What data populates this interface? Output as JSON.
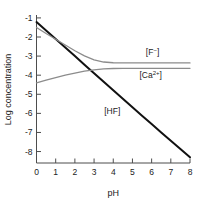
{
  "chart_data": {
    "type": "line",
    "title": "",
    "xlabel": "pH",
    "ylabel": "Log concentration",
    "xlim": [
      0,
      8
    ],
    "ylim": [
      -8.6,
      -0.9
    ],
    "xticks": [
      "0",
      "1",
      "2",
      "3",
      "4",
      "5",
      "6",
      "7",
      "8"
    ],
    "xtick_values": [
      0,
      1,
      2,
      3,
      4,
      5,
      6,
      7,
      8
    ],
    "yticks": [
      "-1",
      "-2",
      "-3",
      "-4",
      "-5",
      "-6",
      "-7",
      "-8"
    ],
    "ytick_values": [
      -1,
      -2,
      -3,
      -4,
      -5,
      -6,
      -7,
      -8
    ],
    "grid": false,
    "legend_position": "inline-annotations",
    "series": [
      {
        "name": "[HF]",
        "label": "[HF]",
        "color": "#111111",
        "width": 2.0,
        "x": [
          0,
          0.5,
          1,
          1.5,
          2,
          2.5,
          3,
          3.5,
          4,
          4.5,
          5,
          5.5,
          6,
          6.5,
          7,
          7.5,
          8
        ],
        "y": [
          -1.22,
          -1.66,
          -2.1,
          -2.55,
          -3.0,
          -3.45,
          -3.9,
          -4.35,
          -4.79,
          -5.24,
          -5.68,
          -6.12,
          -6.56,
          -7.0,
          -7.43,
          -7.87,
          -8.3
        ]
      },
      {
        "name": "[F-]",
        "label": "[F⁻]",
        "color": "#8c8c8c",
        "width": 1.3,
        "x": [
          0,
          0.5,
          1,
          1.5,
          2,
          2.5,
          3,
          3.5,
          4,
          4.5,
          5,
          5.5,
          6,
          6.5,
          7,
          7.5,
          8
        ],
        "y": [
          -1.5,
          -1.82,
          -2.12,
          -2.42,
          -2.72,
          -2.99,
          -3.2,
          -3.31,
          -3.35,
          -3.36,
          -3.36,
          -3.36,
          -3.36,
          -3.36,
          -3.36,
          -3.36,
          -3.36
        ]
      },
      {
        "name": "[Ca2+]",
        "label": "[Ca²⁺]",
        "color": "#8c8c8c",
        "width": 1.3,
        "x": [
          0,
          0.5,
          1,
          1.5,
          2,
          2.5,
          3,
          3.5,
          4,
          4.5,
          5,
          5.5,
          6,
          6.5,
          7,
          7.5,
          8
        ],
        "y": [
          -4.4,
          -4.26,
          -4.13,
          -4.0,
          -3.89,
          -3.79,
          -3.72,
          -3.67,
          -3.65,
          -3.645,
          -3.64,
          -3.64,
          -3.64,
          -3.64,
          -3.64,
          -3.64,
          -3.64
        ]
      }
    ],
    "annotations": [
      {
        "text": "[F⁻]",
        "base": "[F",
        "sup": "−",
        "close": "]",
        "x": 6.05,
        "y": -2.92
      },
      {
        "text": "[Ca²⁺]",
        "base": "[Ca",
        "sup": "2+",
        "close": "]",
        "x": 5.95,
        "y": -4.13
      },
      {
        "text": "[HF]",
        "base": "[HF]",
        "sup": "",
        "close": "",
        "x": 3.95,
        "y": -6.02
      }
    ]
  },
  "axis": {
    "x_title": "pH",
    "y_title": "Log concentration",
    "axis_color": "#4d4d4d"
  },
  "colors": {
    "background": "#ffffff",
    "hf_line": "#111111",
    "f_line": "#8c8c8c",
    "ca_line": "#8c8c8c",
    "text": "#222222"
  }
}
